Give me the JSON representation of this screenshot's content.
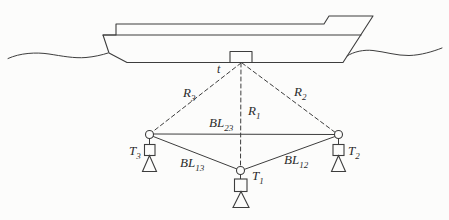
{
  "figure": {
    "colors": {
      "background": "#fcfcfb",
      "line": "#3d3d3d",
      "text": "#2b2b2b"
    },
    "labels": {
      "transducer": "t",
      "range_1": {
        "base": "R",
        "sub": "1"
      },
      "range_2": {
        "base": "R",
        "sub": "2"
      },
      "range_3": {
        "base": "R",
        "sub": "3"
      },
      "baseline_23": {
        "base": "BL",
        "sub": "23"
      },
      "baseline_13": {
        "base": "BL",
        "sub": "13"
      },
      "baseline_12": {
        "base": "BL",
        "sub": "12"
      },
      "transponder_1": {
        "base": "T",
        "sub": "1"
      },
      "transponder_2": {
        "base": "T",
        "sub": "2"
      },
      "transponder_3": {
        "base": "T",
        "sub": "3"
      }
    }
  }
}
